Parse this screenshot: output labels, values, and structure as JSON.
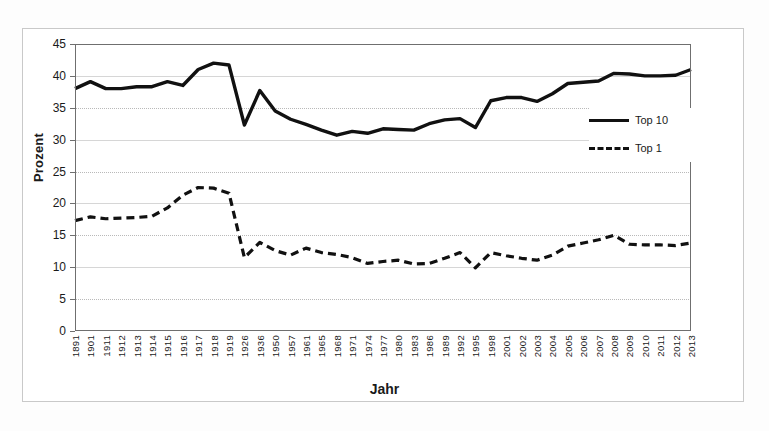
{
  "chart_data": {
    "type": "line",
    "title": "",
    "xlabel": "Jahr",
    "ylabel": "Prozent",
    "ylim": [
      0,
      45
    ],
    "yticks": [
      0,
      5,
      10,
      15,
      20,
      25,
      30,
      35,
      40,
      45
    ],
    "grid": true,
    "legend_position": "right-inside",
    "categories": [
      "1891",
      "1901",
      "1911",
      "1912",
      "1913",
      "1914",
      "1915",
      "1916",
      "1917",
      "1918",
      "1919",
      "1926",
      "1936",
      "1950",
      "1957",
      "1961",
      "1965",
      "1968",
      "1971",
      "1974",
      "1977",
      "1980",
      "1983",
      "1986",
      "1989",
      "1992",
      "1995",
      "1998",
      "2001",
      "2002",
      "2003",
      "2004",
      "2005",
      "2006",
      "2007",
      "2008",
      "2009",
      "2010",
      "2011",
      "2012",
      "2013"
    ],
    "series": [
      {
        "name": "Top 10",
        "style": "solid",
        "color": "#111111",
        "values": [
          38.0,
          39.1,
          38.0,
          38.0,
          38.3,
          38.3,
          39.1,
          38.5,
          41.0,
          42.0,
          41.7,
          32.3,
          37.7,
          34.5,
          33.2,
          32.4,
          31.5,
          30.7,
          31.3,
          31.0,
          31.7,
          31.6,
          31.5,
          32.5,
          33.1,
          33.3,
          31.9,
          36.1,
          36.6,
          36.6,
          36.0,
          37.2,
          38.8,
          39.0,
          39.2,
          40.4,
          40.3,
          40.0,
          40.0,
          40.1,
          41.0
        ]
      },
      {
        "name": "Top 1",
        "style": "dashed",
        "color": "#111111",
        "values": [
          17.3,
          17.9,
          17.6,
          17.7,
          17.8,
          18.0,
          19.3,
          21.3,
          22.5,
          22.4,
          21.6,
          11.5,
          13.9,
          12.6,
          11.9,
          13.0,
          12.3,
          12.0,
          11.5,
          10.6,
          10.9,
          11.1,
          10.5,
          10.6,
          11.4,
          12.3,
          9.9,
          12.3,
          11.8,
          11.4,
          11.1,
          11.9,
          13.3,
          13.8,
          14.3,
          15.0,
          13.6,
          13.5,
          13.5,
          13.4,
          13.8
        ]
      }
    ]
  },
  "axes": {
    "ylabel": "Prozent",
    "xlabel": "Jahr"
  },
  "legend": {
    "items": [
      {
        "label": "Top 10",
        "style": "solid"
      },
      {
        "label": "Top 1",
        "style": "dashed"
      }
    ]
  }
}
